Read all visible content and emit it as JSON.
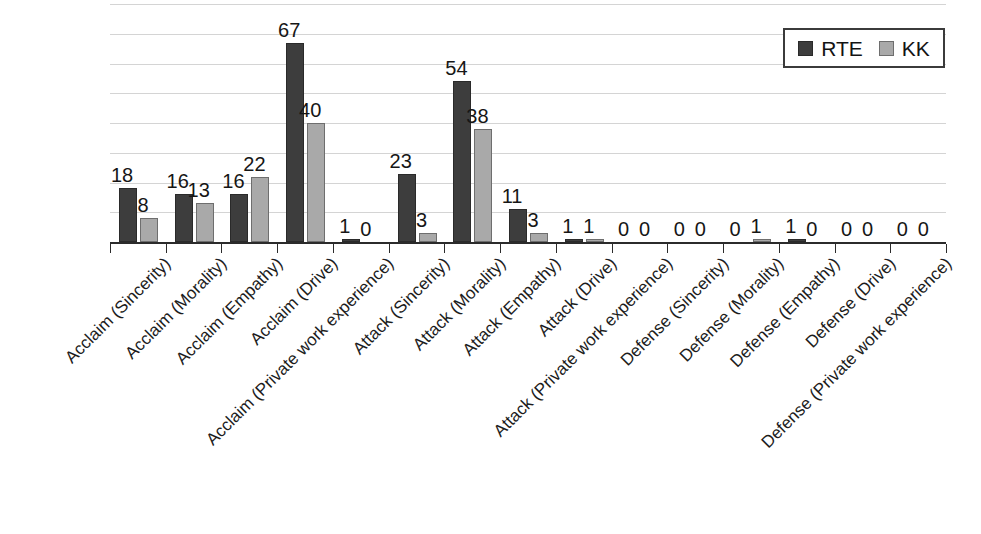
{
  "chart_data": {
    "type": "bar",
    "title": "",
    "subtitle": "",
    "xlabel": "",
    "ylabel": "",
    "ylim": [
      0,
      80
    ],
    "y_tick_labels_visible": false,
    "grid": true,
    "grid_step": 10,
    "legend_position": "top-right",
    "categories": [
      "Acclaim (Sincerity)",
      "Acclaim (Morality)",
      "Acclaim (Empathy)",
      "Acclaim (Drive)",
      "Acclaim (Private work experience)",
      "Attack (Sincerity)",
      "Attack (Morality)",
      "Attack (Empathy)",
      "Attack (Drive)",
      "Attack (Private work experience)",
      "Defense (Sincerity)",
      "Defense (Morality)",
      "Defense (Empathy)",
      "Defense (Drive)",
      "Defense (Private work experience)"
    ],
    "series": [
      {
        "name": "RTE",
        "color": "#3d3d3d",
        "values": [
          18,
          16,
          16,
          67,
          1,
          23,
          54,
          11,
          1,
          0,
          0,
          0,
          1,
          0,
          0
        ]
      },
      {
        "name": "KK",
        "color": "#a9a9a9",
        "values": [
          8,
          13,
          22,
          40,
          0,
          3,
          38,
          3,
          1,
          0,
          0,
          1,
          0,
          0,
          0
        ]
      }
    ]
  },
  "legend": {
    "entries": [
      {
        "label": "RTE",
        "swatch": "dark-gray-square"
      },
      {
        "label": "KK",
        "swatch": "light-gray-square"
      }
    ]
  }
}
